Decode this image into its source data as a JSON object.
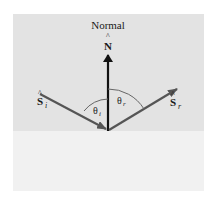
{
  "diagram": {
    "labels": {
      "normal": "Normal",
      "normal_vector": "N",
      "incident_vector": "S",
      "incident_sub": "i",
      "reflected_vector": "S",
      "reflected_sub": "r",
      "theta_i": "θ",
      "theta_i_sub": "i",
      "theta_r": "θ",
      "theta_r_sub": "r"
    },
    "colors": {
      "upper_medium": "#e3e3e3",
      "lower_medium": "#f1f1f1",
      "normal_arrow": "#111111",
      "ray_arrows": "#555555",
      "arc": "#666666"
    }
  }
}
